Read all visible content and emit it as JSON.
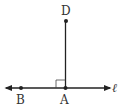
{
  "diagram": {
    "type": "geometry",
    "points": {
      "D": {
        "label": "D",
        "x": 66,
        "y": 21
      },
      "A": {
        "label": "A",
        "x": 65,
        "y": 88
      },
      "B": {
        "label": "B",
        "x": 21,
        "y": 88
      }
    },
    "line": {
      "label": "ℓ"
    },
    "segment": "AD",
    "right_angle_at": "A",
    "colors": {
      "stroke": "#222222"
    }
  }
}
